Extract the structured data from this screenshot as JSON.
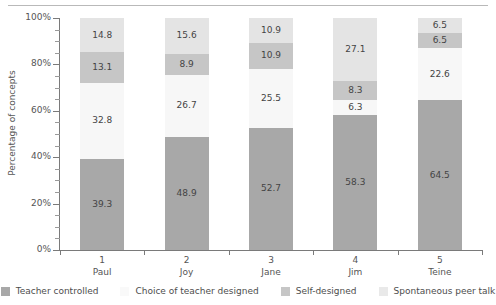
{
  "chart_data": {
    "type": "bar",
    "subtype": "stacked-percentage",
    "title": "",
    "xlabel": "",
    "ylabel": "Percentage of concepts",
    "ylim": [
      0,
      100
    ],
    "ytick_labels": [
      "0%",
      "20%",
      "40%",
      "60%",
      "80%",
      "100%"
    ],
    "ytick_values": [
      0,
      20,
      40,
      60,
      80,
      100
    ],
    "minor_ticks": true,
    "grid": false,
    "legend_position": "bottom",
    "categories": [
      "1",
      "2",
      "3",
      "4",
      "5"
    ],
    "category_names": [
      "Paul",
      "Joy",
      "Jane",
      "Jim",
      "Teine"
    ],
    "series": [
      {
        "name": "Teacher controlled",
        "color": "#a8a8a8",
        "values": [
          39.3,
          48.9,
          52.7,
          58.3,
          64.5
        ]
      },
      {
        "name": "Choice of teacher designed",
        "color": "#f7f7f7",
        "values": [
          32.8,
          26.7,
          25.5,
          6.3,
          22.6
        ]
      },
      {
        "name": "Self-designed",
        "color": "#c6c6c6",
        "values": [
          13.1,
          8.9,
          10.9,
          8.3,
          6.5
        ]
      },
      {
        "name": "Spontaneous peer talk",
        "color": "#e4e4e4",
        "values": [
          14.8,
          15.6,
          10.9,
          27.1,
          6.5
        ]
      }
    ]
  },
  "axis": {
    "y_title": "Percentage of concepts",
    "y_labels": [
      "100%",
      "80%",
      "60%",
      "40%",
      "20%",
      "0%"
    ]
  },
  "legend": {
    "items": [
      {
        "label": "Teacher controlled",
        "color": "#a8a8a8"
      },
      {
        "label": "Choice of teacher designed",
        "color": "#f9f9f9"
      },
      {
        "label": "Self-designed",
        "color": "#c6c6c6"
      },
      {
        "label": "Spontaneous peer talk",
        "color": "#e9e9e9"
      }
    ]
  }
}
